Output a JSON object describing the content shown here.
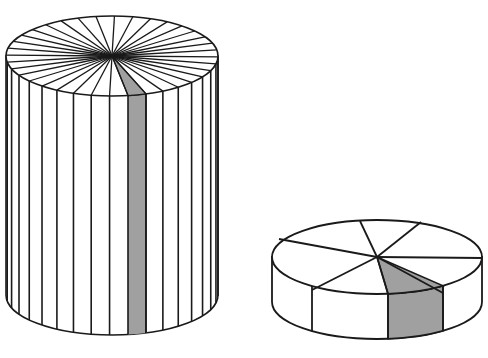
{
  "figure": {
    "colors": {
      "stroke": "#1a1a1a",
      "fill": "#ffffff",
      "shade": "#a0a0a0",
      "background": "#ffffff"
    },
    "tall_cylinder": {
      "cx": 112,
      "top_cy": 56,
      "bottom_cy": 295,
      "rx": 106,
      "ry": 40,
      "sector_count": 36,
      "shaded_front_x": [
        128,
        146
      ]
    },
    "short_cylinder": {
      "cx": 377,
      "top_cy": 257,
      "rx": 105,
      "ry": 37,
      "height": 45,
      "top_radii_endpoints": [
        [
          279,
          239
        ],
        [
          360,
          221
        ],
        [
          421,
          222
        ],
        [
          482,
          258
        ],
        [
          443,
          293
        ],
        [
          388,
          294
        ],
        [
          312,
          290
        ]
      ],
      "front_vertical_x": [
        312,
        388,
        443
      ],
      "shaded_sector": [
        [
          388,
          294
        ],
        [
          443,
          293
        ]
      ]
    }
  }
}
